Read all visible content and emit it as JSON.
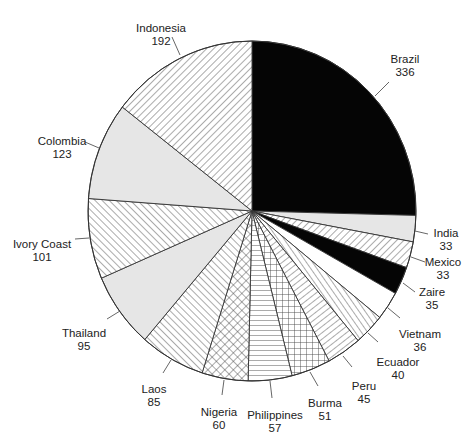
{
  "chart_data": {
    "type": "pie",
    "title": "",
    "start_angle_deg": 0,
    "direction": "clockwise",
    "total": 1322,
    "slices": [
      {
        "label": "Brazil",
        "value": 336,
        "fill": "solid-black",
        "label_pos": [
          405,
          53
        ],
        "leader": [
          [
            389,
            82
          ],
          [
            375,
            96
          ]
        ]
      },
      {
        "label": "India",
        "value": 33,
        "fill": "light-gray",
        "label_pos": [
          446,
          227
        ],
        "leader": [
          [
            428,
            234
          ],
          [
            415,
            231
          ]
        ]
      },
      {
        "label": "Mexico",
        "value": 33,
        "fill": "diag-forward",
        "label_pos": [
          443,
          256
        ],
        "leader": [
          [
            425,
            262
          ],
          [
            411,
            257
          ]
        ]
      },
      {
        "label": "Zaire",
        "value": 35,
        "fill": "solid-black",
        "label_pos": [
          432,
          286
        ],
        "leader": [
          [
            415,
            292
          ],
          [
            403,
            283
          ]
        ]
      },
      {
        "label": "Vietnam",
        "value": 36,
        "fill": "white",
        "label_pos": [
          420,
          328
        ],
        "leader": [
          [
            400,
            318
          ],
          [
            388,
            308
          ]
        ]
      },
      {
        "label": "Ecuador",
        "value": 40,
        "fill": "radial-perp-lines",
        "label_pos": [
          398,
          356
        ],
        "leader": [
          [
            378,
            342
          ],
          [
            368,
            333
          ]
        ]
      },
      {
        "label": "Peru",
        "value": 45,
        "fill": "radial-parallel-lines",
        "label_pos": [
          364,
          380
        ],
        "leader": [
          [
            352,
            367
          ],
          [
            343,
            356
          ]
        ]
      },
      {
        "label": "Burma",
        "value": 51,
        "fill": "square-grid",
        "label_pos": [
          325,
          397
        ],
        "leader": [
          [
            318,
            386
          ],
          [
            310,
            372
          ]
        ]
      },
      {
        "label": "Philippines",
        "value": 57,
        "fill": "horizontal-lines",
        "label_pos": [
          275,
          409
        ],
        "leader": [
          [
            272,
            398
          ],
          [
            270,
            381
          ]
        ]
      },
      {
        "label": "Nigeria",
        "value": 60,
        "fill": "diag-crosshatch",
        "label_pos": [
          219,
          406
        ],
        "leader": [
          [
            222,
            395
          ],
          [
            224,
            380
          ]
        ]
      },
      {
        "label": "Laos",
        "value": 85,
        "fill": "diag-back",
        "label_pos": [
          154,
          383
        ],
        "leader": [
          [
            163,
            373
          ],
          [
            171,
            360
          ]
        ]
      },
      {
        "label": "Thailand",
        "value": 95,
        "fill": "light-gray",
        "label_pos": [
          84,
          327
        ],
        "leader": [
          [
            107,
            319
          ],
          [
            120,
            311
          ]
        ]
      },
      {
        "label": "Ivory Coast",
        "value": 101,
        "fill": "diag-back",
        "label_pos": [
          42,
          238
        ],
        "leader": [
          [
            75,
            239
          ],
          [
            89,
            238
          ]
        ]
      },
      {
        "label": "Colombia",
        "value": 123,
        "fill": "light-gray",
        "label_pos": [
          62,
          135
        ],
        "leader": [
          [
            85,
            142
          ],
          [
            99,
            148
          ]
        ]
      },
      {
        "label": "Indonesia",
        "value": 192,
        "fill": "diag-forward",
        "label_pos": [
          161,
          22
        ],
        "leader": [
          [
            172,
            37
          ],
          [
            180,
            55
          ]
        ]
      }
    ],
    "legend": null,
    "annotations": []
  },
  "geometry": {
    "cx": 252,
    "cy": 211,
    "rx": 164,
    "ry": 170
  },
  "colors": {
    "black": "#050505",
    "light_gray": "#e6e6e6",
    "stroke": "#333333",
    "hatch": "#444444",
    "text": "#222222"
  }
}
